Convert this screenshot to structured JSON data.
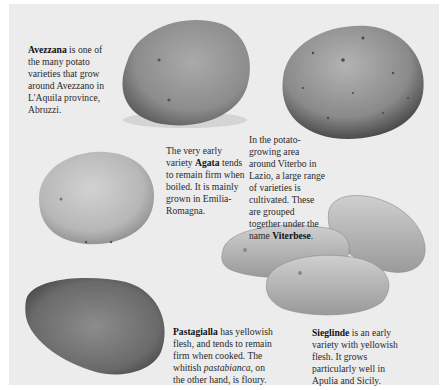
{
  "page": {
    "background": "#ececec",
    "potatoes": [
      {
        "name": "Avezzana",
        "shade": "medium-gray"
      },
      {
        "name": "Viterbese",
        "shade": "speckled-gray"
      },
      {
        "name": "Agata",
        "shade": "light-gray"
      },
      {
        "name": "Sieglinde",
        "shade": "light-elongated-trio"
      },
      {
        "name": "Pastagialla",
        "shade": "dark-gray"
      }
    ],
    "captions": {
      "avezzana": {
        "bold": "Avezzana",
        "text": " is one of the many potato varieties that grow around Avezzano in L'Aquila province, Abruzzi."
      },
      "agata": {
        "pre": "The very early variety ",
        "bold": "Agata",
        "text": " tends to remain firm when boiled. It is mainly grown in Emilia-Romagna."
      },
      "viterbese": {
        "pre": "In the potato-growing area around Viterbo in Lazio, a large range of varieties is cultivated. These are grouped together under the name ",
        "bold": "Viterbese",
        "text": "."
      },
      "pastagialla": {
        "bold": "Pastagialla",
        "text": " has yellowish flesh, and tends to remain firm when cooked. The whitish ",
        "italic": "pastabianca",
        "text2": ", on the other hand, is floury."
      },
      "sieglinde": {
        "bold": "Sieglinde",
        "text": " is an early variety with yellowish flesh. It grows particularly well in Apulia and Sicily."
      }
    }
  }
}
